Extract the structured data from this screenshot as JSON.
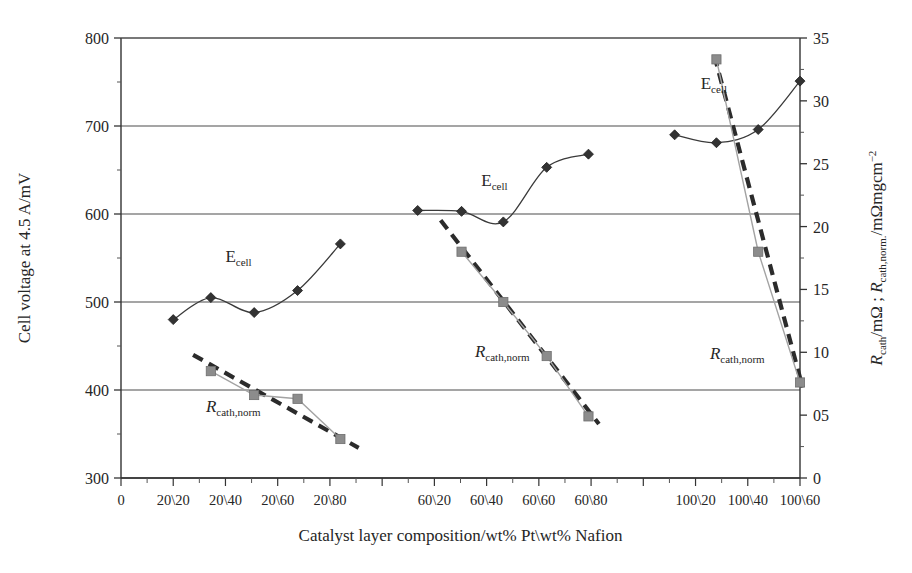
{
  "chart_data": {
    "type": "line",
    "title": "",
    "xlabel": "Catalyst layer composition/wt% Pt\\wt% Nafion",
    "ylabel_left": "Cell voltage at 4.5 A/mV",
    "ylabel_right_part1": "R",
    "ylabel_right_sub1": "cath",
    "ylabel_right_mid": "/mΩ ; ",
    "ylabel_right_part2": "R",
    "ylabel_right_sub2": "cath,norm.",
    "ylabel_right_end": "/mΩmgcm",
    "ylabel_right_sup": "−2",
    "ylabel_right_full": "R_cath/mΩ ; R_cath,norm./mΩmgcm−2",
    "grid": true,
    "legend_position": "inline-annotations",
    "x_categories": [
      "0",
      "20\\20",
      "20\\40",
      "20\\60",
      "20\\80",
      "",
      "60\\20",
      "60\\40",
      "60\\60",
      "60\\80",
      "",
      "100\\20",
      "100\\40",
      "100\\60"
    ],
    "x_tick_labels": [
      "0",
      "20\\20",
      "20\\40",
      "20\\60",
      "20\\80",
      "60\\20",
      "60\\40",
      "60\\60",
      "60\\80",
      "100\\20",
      "100\\40",
      "100\\60"
    ],
    "x_tick_indices": [
      0,
      1,
      2,
      3,
      4,
      6,
      7,
      8,
      9,
      11,
      12,
      13
    ],
    "ylim_left": [
      300,
      800
    ],
    "ytick_labels_left": [
      "300",
      "400",
      "500",
      "600",
      "700",
      "800"
    ],
    "ytick_values_left": [
      300,
      400,
      500,
      600,
      700,
      800
    ],
    "ylim_right": [
      0,
      35
    ],
    "ytick_labels_right": [
      "0",
      "05",
      "10",
      "15",
      "20",
      "25",
      "30",
      "35"
    ],
    "ytick_values_right": [
      0,
      5,
      10,
      15,
      20,
      25,
      30,
      35
    ],
    "annotations": [
      {
        "text": "E",
        "sub": "cell",
        "x_index": 2.25,
        "y_left": 545,
        "name": "ecell-label-group1"
      },
      {
        "text": "E",
        "sub": "cell",
        "x_index": 7.15,
        "y_left": 632,
        "name": "ecell-label-group2"
      },
      {
        "text": "E",
        "sub": "cell",
        "x_index": 11.35,
        "y_left": 742,
        "name": "ecell-label-group3"
      },
      {
        "text": "R",
        "sub": "cath,norm",
        "x_index": 2.15,
        "y_left": 375,
        "name": "rcath-label-group1"
      },
      {
        "text": "R",
        "sub": "cath,norm",
        "x_index": 7.3,
        "y_left": 438,
        "name": "rcath-label-group2"
      },
      {
        "text": "R",
        "sub": "cath,norm",
        "x_index": 11.8,
        "y_left": 435,
        "name": "rcath-label-group3"
      }
    ],
    "series": [
      {
        "name": "E_cell group 1 (20 wt% Pt)",
        "marker": "diamond",
        "axis": "left",
        "color": "#333333",
        "points": [
          {
            "x_index": 1.0,
            "y": 480
          },
          {
            "x_index": 1.72,
            "y": 505
          },
          {
            "x_index": 2.55,
            "y": 488
          },
          {
            "x_index": 3.38,
            "y": 513
          },
          {
            "x_index": 4.2,
            "y": 566
          }
        ]
      },
      {
        "name": "R_cath,norm group 1 (20 wt% Pt)",
        "marker": "square",
        "axis": "right",
        "color": "#8c8c8c",
        "points": [
          {
            "x_index": 1.72,
            "y": 8.5
          },
          {
            "x_index": 2.55,
            "y": 6.6
          },
          {
            "x_index": 3.38,
            "y": 6.3
          },
          {
            "x_index": 4.2,
            "y": 3.1
          }
        ]
      },
      {
        "name": "E_cell group 2 (60 wt% Pt)",
        "marker": "diamond",
        "axis": "left",
        "color": "#333333",
        "points": [
          {
            "x_index": 5.68,
            "y": 604
          },
          {
            "x_index": 6.52,
            "y": 603
          },
          {
            "x_index": 7.32,
            "y": 591
          },
          {
            "x_index": 8.15,
            "y": 653
          },
          {
            "x_index": 8.95,
            "y": 668
          }
        ]
      },
      {
        "name": "R_cath,norm group 2 (60 wt% Pt)",
        "marker": "square",
        "axis": "right",
        "color": "#8c8c8c",
        "points": [
          {
            "x_index": 6.52,
            "y": 18.0
          },
          {
            "x_index": 7.32,
            "y": 14.0
          },
          {
            "x_index": 8.15,
            "y": 9.7
          },
          {
            "x_index": 8.95,
            "y": 4.9
          }
        ]
      },
      {
        "name": "E_cell group 3 (100 wt% Pt)",
        "marker": "diamond",
        "axis": "left",
        "color": "#333333",
        "points": [
          {
            "x_index": 10.6,
            "y": 690
          },
          {
            "x_index": 11.4,
            "y": 681
          },
          {
            "x_index": 12.2,
            "y": 696
          },
          {
            "x_index": 13.0,
            "y": 751
          }
        ]
      },
      {
        "name": "R_cath,norm group 3 (100 wt% Pt)",
        "marker": "square",
        "axis": "right",
        "color": "#8c8c8c",
        "points": [
          {
            "x_index": 11.4,
            "y": 33.3
          },
          {
            "x_index": 12.2,
            "y": 18.0
          },
          {
            "x_index": 13.0,
            "y": 7.6
          }
        ]
      }
    ],
    "trendlines": [
      {
        "name": "trend-group1",
        "x1_index": 1.38,
        "y1": 9.8,
        "x2_index": 4.55,
        "y2": 2.4,
        "style": "dashed"
      },
      {
        "name": "trend-group2",
        "x1_index": 6.12,
        "y1": 20.5,
        "x2_index": 9.15,
        "y2": 4.3,
        "style": "dashed"
      },
      {
        "name": "trend-group3",
        "x1_index": 11.36,
        "y1": 33.6,
        "x2_index": 13.05,
        "y2": 7.2,
        "style": "dashed"
      }
    ]
  }
}
